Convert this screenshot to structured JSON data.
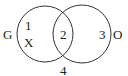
{
  "diagram": {
    "type": "venn",
    "colors": {
      "stroke": "#333333",
      "text": "#222222",
      "background": "#ffffff"
    },
    "sets": [
      {
        "name": "G",
        "label": "G",
        "cx": 45,
        "cy": 34,
        "r": 28
      },
      {
        "name": "O",
        "label": "O",
        "cx": 82,
        "cy": 34,
        "r": 29
      }
    ],
    "regions": [
      {
        "id": "1",
        "label": "1",
        "location": "G only"
      },
      {
        "id": "2",
        "label": "2",
        "location": "G and O"
      },
      {
        "id": "3",
        "label": "3",
        "location": "O only"
      },
      {
        "id": "4",
        "label": "4",
        "location": "outside both"
      }
    ],
    "marker": {
      "label": "X",
      "region": "1"
    }
  }
}
